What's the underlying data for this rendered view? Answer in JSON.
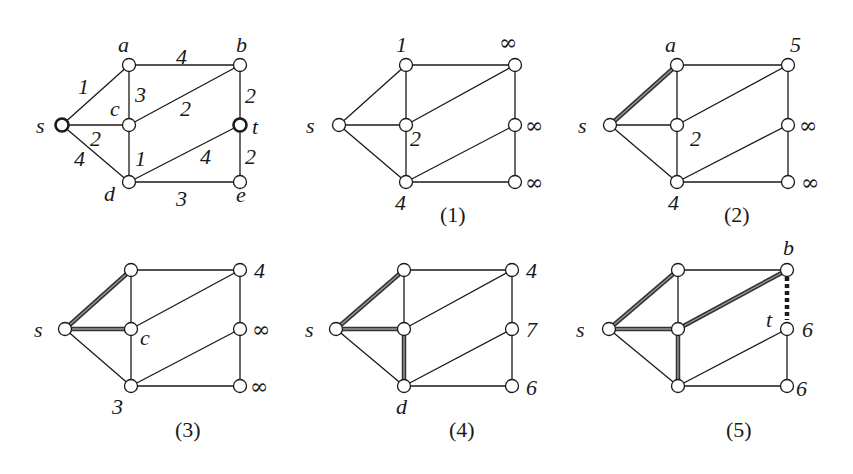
{
  "figure": {
    "edges": [
      {
        "u": "s",
        "v": "a",
        "w": "1"
      },
      {
        "u": "s",
        "v": "c",
        "w": "2"
      },
      {
        "u": "s",
        "v": "d",
        "w": "4"
      },
      {
        "u": "a",
        "v": "b",
        "w": "4"
      },
      {
        "u": "a",
        "v": "c",
        "w": "3"
      },
      {
        "u": "c",
        "v": "b",
        "w": "2"
      },
      {
        "u": "c",
        "v": "d",
        "w": "1"
      },
      {
        "u": "b",
        "v": "t",
        "w": "2"
      },
      {
        "u": "d",
        "v": "t",
        "w": "4"
      },
      {
        "u": "t",
        "v": "e",
        "w": "2"
      },
      {
        "u": "d",
        "v": "e",
        "w": "3"
      }
    ],
    "panels": [
      {
        "caption": "",
        "labels": {
          "s": "s",
          "a": "a",
          "b": "b",
          "c": "c",
          "d": "d",
          "t": "t",
          "e": "e"
        },
        "weights": {
          "sa": "1",
          "sc": "2",
          "sd": "4",
          "ab": "4",
          "ac": "3",
          "cb": "2",
          "cd": "1",
          "bt": "2",
          "dt": "4",
          "te": "2",
          "de": "3"
        }
      },
      {
        "caption": "(1)",
        "labels": {
          "s": "s",
          "a": "1",
          "c": "2",
          "d": "4",
          "b": "∞",
          "t": "∞",
          "e": "∞"
        }
      },
      {
        "caption": "(2)",
        "labels": {
          "s": "s",
          "a": "a",
          "c": "2",
          "d": "4",
          "b": "5",
          "t": "∞",
          "e": "∞"
        }
      },
      {
        "caption": "(3)",
        "labels": {
          "s": "s",
          "c": "c",
          "d": "3",
          "b": "4",
          "t": "∞",
          "e": "∞"
        }
      },
      {
        "caption": "(4)",
        "labels": {
          "s": "s",
          "d": "d",
          "b": "4",
          "t": "7",
          "e": "6"
        }
      },
      {
        "caption": "(5)",
        "labels": {
          "s": "s",
          "b": "b",
          "t": "t",
          "t_val": "6",
          "e": "6"
        }
      }
    ]
  }
}
